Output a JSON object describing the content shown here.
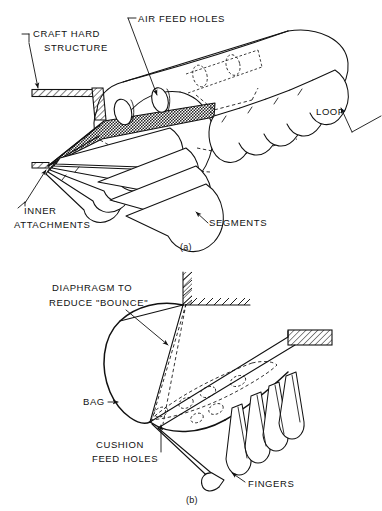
{
  "figure": {
    "panels": [
      {
        "id": "a",
        "caption": "(a)",
        "labels": [
          {
            "key": "craft_hard_structure",
            "text_line1": "CRAFT HARD",
            "text_line2": "STRUCTURE"
          },
          {
            "key": "air_feed_holes",
            "text": "AIR FEED HOLES"
          },
          {
            "key": "loop",
            "text": "LOOP"
          },
          {
            "key": "segments",
            "text": "SEGMENTS"
          },
          {
            "key": "inner_attachments",
            "text_line1": "INNER",
            "text_line2": "ATTACHMENTS"
          }
        ]
      },
      {
        "id": "b",
        "caption": "(b)",
        "labels": [
          {
            "key": "diaphragm",
            "text_line1": "DIAPHRAGM TO",
            "text_line2": "REDUCE \"BOUNCE\""
          },
          {
            "key": "bag",
            "text": "BAG"
          },
          {
            "key": "cushion_feed_holes",
            "text_line1": "CUSHION",
            "text_line2": "FEED HOLES"
          },
          {
            "key": "fingers",
            "text": "FINGERS"
          }
        ]
      }
    ],
    "colors": {
      "line": "#111111",
      "background": "#ffffff",
      "shaded_diaphragm": "#8e8e8e"
    }
  }
}
